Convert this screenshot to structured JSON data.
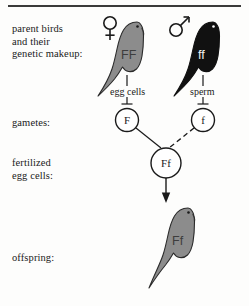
{
  "diagram": {
    "top_rule": true
  },
  "row_labels": {
    "parents": "parent birds\nand their\ngenetic makeup:",
    "gametes": "gametes:",
    "fertilized": "fertilized\negg cells:",
    "offspring": "offspring:"
  },
  "parents": {
    "female": {
      "symbol": "venus-symbol",
      "genotype": "FF",
      "body_color": "#8c8c8c",
      "outline_color": "#2b2b2b",
      "gamete_label": "egg cells"
    },
    "male": {
      "symbol": "mars-symbol",
      "genotype": "ff",
      "body_color": "#111111",
      "outline_color": "#111111",
      "gamete_label": "sperm"
    }
  },
  "gametes": {
    "egg": "F",
    "sperm": "f"
  },
  "zygote": {
    "genotype": "Ff"
  },
  "offspring": {
    "genotype": "Ff",
    "body_color": "#8c8c8c",
    "outline_color": "#2b2b2b"
  },
  "colors": {
    "ink": "#1a1a1a",
    "rule": "#3a3a3a",
    "gray_bird": "#8c8c8c",
    "black_bird": "#111111",
    "page": "#fdfdfc"
  }
}
